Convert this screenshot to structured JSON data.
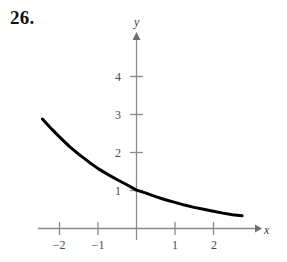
{
  "problem": {
    "number": "26."
  },
  "chart_data": {
    "type": "line",
    "title": "",
    "subtitle": "",
    "xlabel": "x",
    "ylabel": "y",
    "grid": false,
    "legend": null,
    "xlim": [
      -2.8,
      3.0
    ],
    "ylim": [
      -0.5,
      4.9
    ],
    "x_ticks": [
      -2,
      -1,
      1,
      2
    ],
    "x_tick_labels": [
      "−2",
      "−1",
      "1",
      "2"
    ],
    "y_ticks": [
      1,
      2,
      3,
      4
    ],
    "y_tick_labels": [
      "1",
      "2",
      "3",
      "4"
    ],
    "axis_arrows": [
      "x-positive",
      "y-positive"
    ],
    "series": [
      {
        "name": "decaying exponential",
        "description": "smooth decreasing exponential curve passing through (0, 1)",
        "color": "#000000",
        "x": [
          -2.45,
          -2.2,
          -2.0,
          -1.75,
          -1.5,
          -1.25,
          -1.0,
          -0.75,
          -0.5,
          -0.25,
          0.0,
          0.25,
          0.5,
          0.75,
          1.0,
          1.25,
          1.5,
          1.75,
          2.0,
          2.25,
          2.5,
          2.75
        ],
        "y": [
          2.85,
          2.58,
          2.38,
          2.14,
          1.93,
          1.74,
          1.56,
          1.41,
          1.27,
          1.14,
          1.0,
          0.92,
          0.83,
          0.75,
          0.68,
          0.61,
          0.55,
          0.5,
          0.45,
          0.4,
          0.36,
          0.33
        ]
      }
    ],
    "colors": {
      "curve": "#000000",
      "axis": "#8a8a8a",
      "tick_text": "#4a4a4a",
      "background": "#ffffff"
    }
  }
}
